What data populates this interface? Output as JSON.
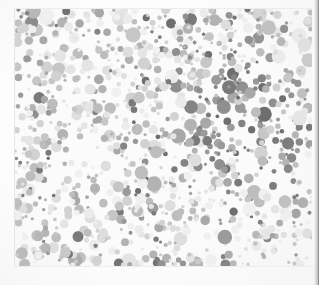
{
  "document": {
    "kind": "scanned-image",
    "subject": "ishihara-pseudoisochromatic-plate",
    "rendering": "grayscale",
    "caption": "",
    "title": "",
    "visible_text": []
  },
  "canvas": {
    "width": 319,
    "height": 285,
    "background_color": "#ffffff"
  },
  "plate": {
    "field_x": 15,
    "field_y": 9,
    "field_width": 297,
    "field_height": 257,
    "field_background": "#fbfbfb",
    "margin_left": 15,
    "margin_top": 9,
    "margin_right": 7,
    "margin_bottom": 19
  },
  "edges": {
    "left_line_color": "#e6e6e6",
    "top_line_color": "#ededed",
    "bottom_line_color": "#eeeeee",
    "right_shadow_color": "#8f8f8f",
    "right_shadow_width": 5
  },
  "dots": {
    "approx_count": 1150,
    "min_diameter": 3,
    "max_diameter": 16,
    "palette_light": [
      "#f0f0f0",
      "#ebebeb",
      "#e5e5e5",
      "#dedede"
    ],
    "palette_mid": [
      "#d2d2d2",
      "#c6c6c6",
      "#bdbdbd",
      "#b3b3b3",
      "#a8a8a8"
    ],
    "palette_dark": [
      "#9a9a9a",
      "#8f8f8f",
      "#848484",
      "#7a7a7a",
      "#6e6e6e"
    ],
    "dark_cluster": {
      "description": "concentration of darker dots forming a faint indistinct stroke",
      "center_x": 0.78,
      "center_y": 0.42,
      "radius": 0.34
    },
    "random_seed": 20240517
  },
  "chart_data": {
    "type": "scatter",
    "title": "",
    "xlabel": "",
    "ylabel": "",
    "note": "Pseudoisochromatic dot mosaic; no axes, no legend, no tick labels, no annotations are rendered in the source image.",
    "series": [
      {
        "name": "light-dots",
        "color": "#e5e5e5",
        "approx_count": 330
      },
      {
        "name": "mid-dots",
        "color": "#bdbdbd",
        "approx_count": 560
      },
      {
        "name": "dark-dots",
        "color": "#8a8a8a",
        "approx_count": 260
      }
    ]
  }
}
